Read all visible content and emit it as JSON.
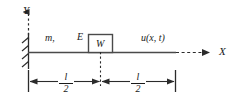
{
  "figure": {
    "type": "engineering-schematic",
    "width": 238,
    "height": 102,
    "background_color": "#ffffff",
    "line_color": "#404040",
    "text_color": "#1a1a1a"
  },
  "axes": {
    "y_label": "Y",
    "x_label": "X",
    "y_axis_style": "dashed-with-arrow-up",
    "x_axis_style": "dashed-with-arrow-right"
  },
  "labels": {
    "mass_density": "m,",
    "youngs_modulus": "E",
    "block": "W",
    "displacement": "u(x, t)"
  },
  "dimensions": {
    "left": {
      "numerator": "l",
      "denominator": "2"
    },
    "right": {
      "numerator": "l",
      "denominator": "2"
    }
  },
  "support": {
    "kind": "fixed-wall",
    "hatch_count": 4
  }
}
